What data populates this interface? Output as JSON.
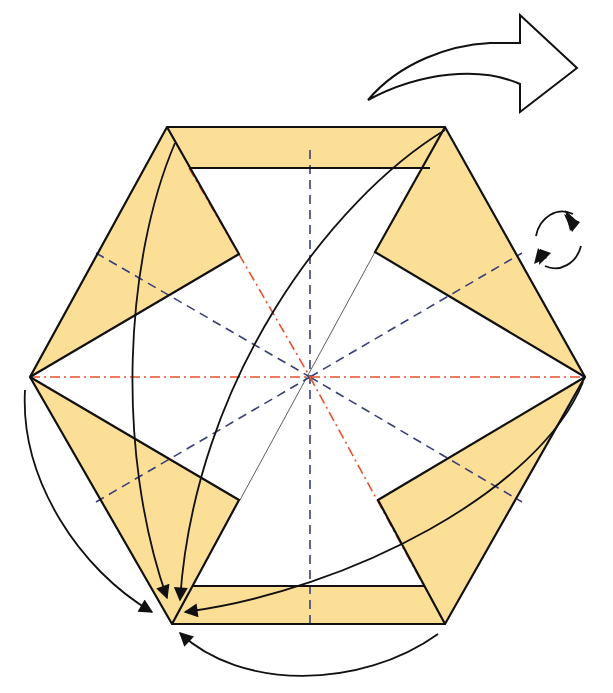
{
  "diagram": {
    "title": "Origami hexagon folding step",
    "colors": {
      "paper_colored": "#fbdf96",
      "paper_white": "#ffffff",
      "outline": "#111111",
      "valley_fold": "#3a3f7a",
      "mountain_fold": "#e8502a"
    },
    "symbols": [
      {
        "name": "turn-over-arrow",
        "meaning": "turn the model over"
      },
      {
        "name": "rotate-arrows",
        "meaning": "rotate / repeat"
      },
      {
        "name": "fold-arrows",
        "meaning": "fold corners to the bottom-left vertex"
      }
    ],
    "legend": {
      "valley": "dashed line = valley fold",
      "mountain": "dash-dot line = mountain fold"
    }
  }
}
